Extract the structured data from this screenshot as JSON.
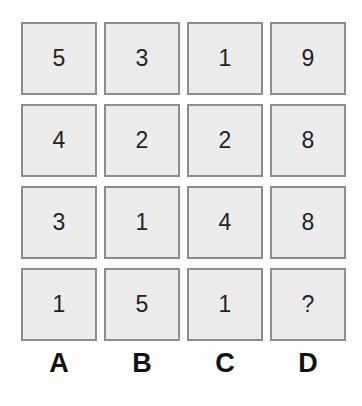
{
  "puzzle": {
    "type": "number-grid-puzzle",
    "background_color": "#fdfdfd",
    "cell_fill_color": "#ececec",
    "cell_border_color": "#8d8d8d",
    "value_text_color": "#232323",
    "label_text_color": "#111111",
    "column_labels": [
      "A",
      "B",
      "C",
      "D"
    ],
    "rows": [
      {
        "cells": [
          "5",
          "3",
          "1",
          "9"
        ]
      },
      {
        "cells": [
          "4",
          "2",
          "2",
          "8"
        ]
      },
      {
        "cells": [
          "3",
          "1",
          "4",
          "8"
        ]
      },
      {
        "cells": [
          "1",
          "5",
          "1",
          "?"
        ]
      }
    ],
    "columns": [
      {
        "label": "A",
        "values": [
          "5",
          "4",
          "3",
          "1"
        ]
      },
      {
        "label": "B",
        "values": [
          "3",
          "2",
          "1",
          "5"
        ]
      },
      {
        "label": "C",
        "values": [
          "1",
          "2",
          "4",
          "1"
        ]
      },
      {
        "label": "D",
        "values": [
          "9",
          "8",
          "8",
          "?"
        ]
      }
    ],
    "unknown_marker": "?",
    "unknown_position": {
      "row": 4,
      "column": "D"
    }
  },
  "chart_data": {
    "type": "table",
    "title": "",
    "categories": [
      "A",
      "B",
      "C",
      "D"
    ],
    "series": [
      {
        "name": "Row 1",
        "values": [
          5,
          3,
          1,
          9
        ]
      },
      {
        "name": "Row 2",
        "values": [
          4,
          2,
          2,
          8
        ]
      },
      {
        "name": "Row 3",
        "values": [
          3,
          1,
          4,
          8
        ]
      },
      {
        "name": "Row 4",
        "values": [
          1,
          5,
          1,
          null
        ]
      }
    ],
    "cell_labels": [
      [
        "5",
        "3",
        "1",
        "9"
      ],
      [
        "4",
        "2",
        "2",
        "8"
      ],
      [
        "3",
        "1",
        "4",
        "8"
      ],
      [
        "1",
        "5",
        "1",
        "?"
      ]
    ],
    "xlabel": "",
    "ylabel": "",
    "grid": false,
    "legend": "none"
  }
}
